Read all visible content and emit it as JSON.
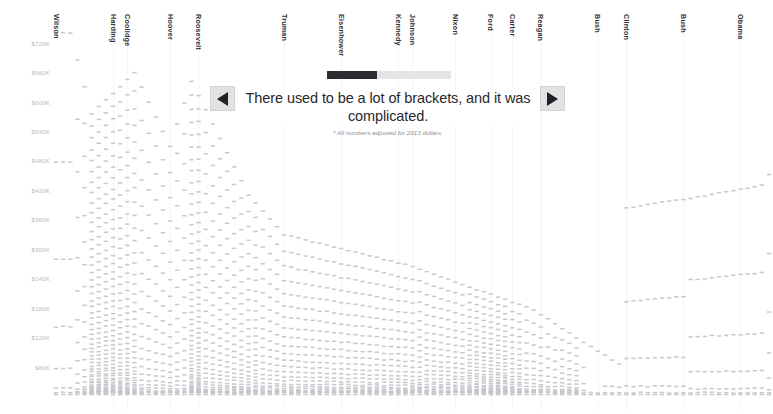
{
  "chart_data": {
    "type": "scatter",
    "title": "There used to be a lot of brackets, and it was complicated.",
    "subtitle": "",
    "xlabel": "",
    "ylabel": "",
    "footnote": "* All numbers adjusted for 2013 dollars.",
    "grid": true,
    "legend_position": "none",
    "ylim": [
      0,
      750000
    ],
    "y_ticks": [
      {
        "label": "$720K",
        "value": 720000
      },
      {
        "label": "$660K",
        "value": 660000
      },
      {
        "label": "$600K",
        "value": 600000
      },
      {
        "label": "$540K",
        "value": 540000
      },
      {
        "label": "$480K",
        "value": 480000
      },
      {
        "label": "$420K",
        "value": 420000
      },
      {
        "label": "$360K",
        "value": 360000
      },
      {
        "label": "$300K",
        "value": 300000
      },
      {
        "label": "$240K",
        "value": 240000
      },
      {
        "label": "$180K",
        "value": 180000
      },
      {
        "label": "$120K",
        "value": 120000
      },
      {
        "label": "$60K",
        "value": 60000
      }
    ],
    "x_categories": [
      {
        "label": "Wilson",
        "start_year": 1913,
        "end_year": 1921
      },
      {
        "label": "Harding",
        "start_year": 1921,
        "end_year": 1923
      },
      {
        "label": "Coolidge",
        "start_year": 1923,
        "end_year": 1929
      },
      {
        "label": "Hoover",
        "start_year": 1929,
        "end_year": 1933
      },
      {
        "label": "Roosevelt",
        "start_year": 1933,
        "end_year": 1945
      },
      {
        "label": "Truman",
        "start_year": 1945,
        "end_year": 1953
      },
      {
        "label": "Eisenhower",
        "start_year": 1953,
        "end_year": 1961
      },
      {
        "label": "Kennedy",
        "start_year": 1961,
        "end_year": 1963
      },
      {
        "label": "Johnson",
        "start_year": 1963,
        "end_year": 1969
      },
      {
        "label": "Nixon",
        "start_year": 1969,
        "end_year": 1974
      },
      {
        "label": "Ford",
        "start_year": 1974,
        "end_year": 1977
      },
      {
        "label": "Carter",
        "start_year": 1977,
        "end_year": 1981
      },
      {
        "label": "Reagan",
        "start_year": 1981,
        "end_year": 1989
      },
      {
        "label": "Bush",
        "start_year": 1989,
        "end_year": 1993
      },
      {
        "label": "Clinton",
        "start_year": 1993,
        "end_year": 2001
      },
      {
        "label": "Bush",
        "start_year": 2001,
        "end_year": 2009
      },
      {
        "label": "Obama",
        "start_year": 2009,
        "end_year": 2013
      }
    ],
    "mark_color": "#c3c6ca",
    "bracket_counts_by_year": [
      {
        "year": 1913,
        "count": 7
      },
      {
        "year": 1914,
        "count": 7
      },
      {
        "year": 1915,
        "count": 7
      },
      {
        "year": 1916,
        "count": 14
      },
      {
        "year": 1917,
        "count": 21
      },
      {
        "year": 1918,
        "count": 56
      },
      {
        "year": 1919,
        "count": 56
      },
      {
        "year": 1920,
        "count": 56
      },
      {
        "year": 1921,
        "count": 56
      },
      {
        "year": 1922,
        "count": 50
      },
      {
        "year": 1923,
        "count": 50
      },
      {
        "year": 1924,
        "count": 43
      },
      {
        "year": 1925,
        "count": 23
      },
      {
        "year": 1926,
        "count": 23
      },
      {
        "year": 1927,
        "count": 23
      },
      {
        "year": 1928,
        "count": 23
      },
      {
        "year": 1929,
        "count": 23
      },
      {
        "year": 1930,
        "count": 23
      },
      {
        "year": 1931,
        "count": 23
      },
      {
        "year": 1932,
        "count": 55
      },
      {
        "year": 1933,
        "count": 55
      },
      {
        "year": 1934,
        "count": 31
      },
      {
        "year": 1935,
        "count": 31
      },
      {
        "year": 1936,
        "count": 31
      },
      {
        "year": 1937,
        "count": 31
      },
      {
        "year": 1938,
        "count": 31
      },
      {
        "year": 1939,
        "count": 31
      },
      {
        "year": 1940,
        "count": 31
      },
      {
        "year": 1941,
        "count": 32
      },
      {
        "year": 1942,
        "count": 24
      },
      {
        "year": 1943,
        "count": 24
      },
      {
        "year": 1944,
        "count": 24
      },
      {
        "year": 1945,
        "count": 24
      },
      {
        "year": 1946,
        "count": 24
      },
      {
        "year": 1947,
        "count": 24
      },
      {
        "year": 1948,
        "count": 24
      },
      {
        "year": 1949,
        "count": 24
      },
      {
        "year": 1950,
        "count": 24
      },
      {
        "year": 1951,
        "count": 24
      },
      {
        "year": 1952,
        "count": 24
      },
      {
        "year": 1953,
        "count": 24
      },
      {
        "year": 1954,
        "count": 24
      },
      {
        "year": 1955,
        "count": 24
      },
      {
        "year": 1956,
        "count": 24
      },
      {
        "year": 1957,
        "count": 24
      },
      {
        "year": 1958,
        "count": 24
      },
      {
        "year": 1959,
        "count": 24
      },
      {
        "year": 1960,
        "count": 24
      },
      {
        "year": 1961,
        "count": 24
      },
      {
        "year": 1962,
        "count": 24
      },
      {
        "year": 1963,
        "count": 24
      },
      {
        "year": 1964,
        "count": 26
      },
      {
        "year": 1965,
        "count": 25
      },
      {
        "year": 1966,
        "count": 25
      },
      {
        "year": 1967,
        "count": 25
      },
      {
        "year": 1968,
        "count": 25
      },
      {
        "year": 1969,
        "count": 25
      },
      {
        "year": 1970,
        "count": 25
      },
      {
        "year": 1971,
        "count": 33
      },
      {
        "year": 1972,
        "count": 33
      },
      {
        "year": 1973,
        "count": 33
      },
      {
        "year": 1974,
        "count": 33
      },
      {
        "year": 1975,
        "count": 33
      },
      {
        "year": 1976,
        "count": 33
      },
      {
        "year": 1977,
        "count": 25
      },
      {
        "year": 1978,
        "count": 25
      },
      {
        "year": 1979,
        "count": 16
      },
      {
        "year": 1980,
        "count": 16
      },
      {
        "year": 1981,
        "count": 16
      },
      {
        "year": 1982,
        "count": 12
      },
      {
        "year": 1983,
        "count": 12
      },
      {
        "year": 1984,
        "count": 14
      },
      {
        "year": 1985,
        "count": 14
      },
      {
        "year": 1986,
        "count": 14
      },
      {
        "year": 1987,
        "count": 5
      },
      {
        "year": 1988,
        "count": 2
      },
      {
        "year": 1989,
        "count": 2
      },
      {
        "year": 1990,
        "count": 3
      },
      {
        "year": 1991,
        "count": 3
      },
      {
        "year": 1992,
        "count": 3
      },
      {
        "year": 1993,
        "count": 5
      },
      {
        "year": 1994,
        "count": 5
      },
      {
        "year": 1995,
        "count": 5
      },
      {
        "year": 1996,
        "count": 5
      },
      {
        "year": 1997,
        "count": 5
      },
      {
        "year": 1998,
        "count": 5
      },
      {
        "year": 1999,
        "count": 5
      },
      {
        "year": 2000,
        "count": 5
      },
      {
        "year": 2001,
        "count": 5
      },
      {
        "year": 2002,
        "count": 6
      },
      {
        "year": 2003,
        "count": 6
      },
      {
        "year": 2004,
        "count": 6
      },
      {
        "year": 2005,
        "count": 6
      },
      {
        "year": 2006,
        "count": 6
      },
      {
        "year": 2007,
        "count": 6
      },
      {
        "year": 2008,
        "count": 6
      },
      {
        "year": 2009,
        "count": 6
      },
      {
        "year": 2010,
        "count": 6
      },
      {
        "year": 2011,
        "count": 6
      },
      {
        "year": 2012,
        "count": 6
      },
      {
        "year": 2013,
        "count": 7
      }
    ]
  },
  "overlay": {
    "headline": "There used to be a lot of brackets, and it was complicated.",
    "footnote": "* All numbers adjusted for 2013 dollars.",
    "prev_label": "◀",
    "next_label": "▶",
    "progress_percent": 40
  },
  "colors": {
    "background": "#ffffff",
    "mark": "#c3c6ca",
    "axis_text": "#b9bcc0",
    "pres_text": "#2e3033",
    "gridline": "#f0f1f2",
    "progress_fill": "#2b2d30",
    "progress_track": "#e3e4e6",
    "button_bg": "#e1e2e4",
    "button_glyph": "#1f2124"
  }
}
